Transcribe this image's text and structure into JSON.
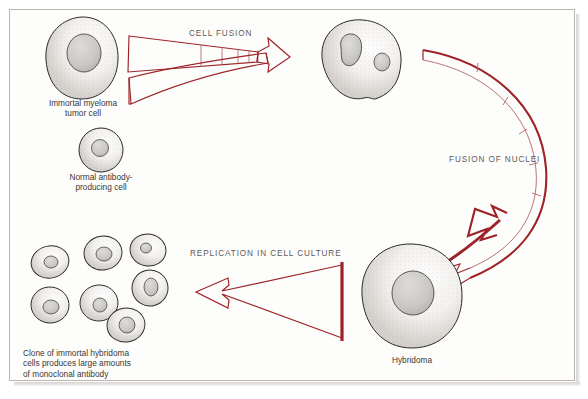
{
  "figure": {
    "background_color": "#fdfdfc",
    "border_color": "#b9b6b4",
    "arrow_color": "#9d2328",
    "cell_outline_color": "#2b2927",
    "nucleus_fill": "#c8c7c4",
    "caption_color": "#5d5a58",
    "label_color": "#3a3836"
  },
  "process_captions": [
    {
      "id": "cell-fusion",
      "text": "CELL FUSION"
    },
    {
      "id": "fusion-of-nuclei",
      "text": "FUSION OF NUCLEI"
    },
    {
      "id": "replication",
      "text": "REPLICATION IN CELL CULTURE"
    }
  ],
  "cell_labels": [
    {
      "id": "myeloma",
      "lines": [
        "Immortal myeloma",
        "tumor cell"
      ]
    },
    {
      "id": "normal",
      "lines": [
        "Normal antibody-",
        "producing cell"
      ]
    },
    {
      "id": "hybridoma",
      "lines": [
        "Hybridoma"
      ]
    },
    {
      "id": "clone",
      "lines": [
        "Clone of immortal hybridoma",
        "cells produces large amounts",
        "of monoclonal antibody"
      ]
    }
  ],
  "label_text": {
    "myeloma_l1": "Immortal myeloma",
    "myeloma_l2": "tumor cell",
    "normal_l1": "Normal antibody-",
    "normal_l2": "producing cell",
    "hybridoma": "Hybridoma",
    "clone_l1": "Clone of immortal hybridoma",
    "clone_l2": "cells produces large amounts",
    "clone_l3": "of monoclonal antibody"
  },
  "caption_text": {
    "cell_fusion": "CELL FUSION",
    "fusion_of_nuclei": "FUSION OF NUCLEI",
    "replication": "REPLICATION IN CELL CULTURE"
  },
  "cells": {
    "myeloma_tumor_cell": {
      "nuclei": 1,
      "size": "large"
    },
    "normal_antibody_cell": {
      "nuclei": 1,
      "size": "small"
    },
    "binucleate_fused_cell": {
      "nuclei": 2,
      "size": "large"
    },
    "hybridoma_cell": {
      "nuclei": 1,
      "size": "large"
    },
    "clone_cells_count": 7
  }
}
